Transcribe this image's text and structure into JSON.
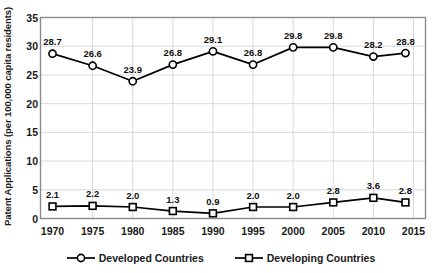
{
  "chart_data": {
    "type": "line",
    "title": "",
    "xlabel": "",
    "ylabel": "Patent Applications (per 100,000 capita residents)",
    "x": [
      1970,
      1975,
      1980,
      1985,
      1990,
      1995,
      2000,
      2005,
      2010,
      2014
    ],
    "xticklabels": [
      "1970",
      "1975",
      "1980",
      "1985",
      "1990",
      "1995",
      "2000",
      "2005",
      "2010",
      "2015"
    ],
    "xticks": [
      1970,
      1975,
      1980,
      1985,
      1990,
      1995,
      2000,
      2005,
      2010,
      2015
    ],
    "xlim": [
      1968.5,
      2016.5
    ],
    "ylim": [
      0,
      35
    ],
    "yticks": [
      0,
      5,
      10,
      15,
      20,
      25,
      30,
      35
    ],
    "yticklabels": [
      "0",
      "5",
      "10",
      "15",
      "20",
      "25",
      "30",
      "35"
    ],
    "grid": true,
    "legend_position": "bottom",
    "series": [
      {
        "name": "Developed Countries",
        "marker": "circle",
        "color": "#000000",
        "values": [
          28.7,
          26.6,
          23.9,
          26.8,
          29.1,
          26.8,
          29.8,
          29.8,
          28.2,
          28.8
        ],
        "labels": [
          "28.7",
          "26.6",
          "23.9",
          "26.8",
          "29.1",
          "26.8",
          "29.8",
          "29.8",
          "28.2",
          "28.8"
        ]
      },
      {
        "name": "Developing Countries",
        "marker": "square",
        "color": "#000000",
        "values": [
          2.1,
          2.2,
          2.0,
          1.3,
          0.9,
          2.0,
          2.0,
          2.8,
          3.6,
          2.8
        ],
        "labels": [
          "2.1",
          "2.2",
          "2.0",
          "1.3",
          "0.9",
          "2.0",
          "2.0",
          "2.8",
          "3.6",
          "2.8"
        ]
      }
    ]
  },
  "legend": {
    "entries": [
      {
        "label": "Developed Countries",
        "marker": "circle-marker"
      },
      {
        "label": "Developing Countries",
        "marker": "square-marker"
      }
    ]
  }
}
